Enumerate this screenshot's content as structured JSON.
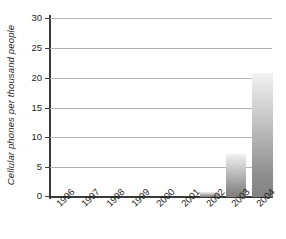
{
  "chart_data": {
    "type": "bar",
    "title": "",
    "subtitle": "",
    "xlabel": "",
    "ylabel": "Cellular phones per thousand people",
    "categories": [
      "1996",
      "1997",
      "1998",
      "1999",
      "2000",
      "2001",
      "2002",
      "2003",
      "2004"
    ],
    "values": [
      0,
      0,
      0,
      0,
      0,
      0,
      0.8,
      7.2,
      20.8
    ],
    "ylim": [
      0,
      30
    ],
    "yticks": [
      0,
      5,
      10,
      15,
      20,
      25,
      30
    ],
    "ytick_labels": [
      "0",
      "5",
      "10",
      "15",
      "20",
      "25",
      "30"
    ],
    "grid": true,
    "legend": "none",
    "series": [
      {
        "name": "Cellular phones per thousand people",
        "values": [
          0,
          0,
          0,
          0,
          0,
          0,
          0.8,
          7.2,
          20.8
        ]
      }
    ],
    "bar_fill": "vertical-gradient-light-to-gray",
    "colors": {
      "bar_top": "#f2f2f2",
      "bar_bottom": "#828282",
      "axis": "#3a3a3a",
      "gridline": "#b4b4b4",
      "text": "#1d1d1d",
      "background": "#ffffff"
    }
  }
}
